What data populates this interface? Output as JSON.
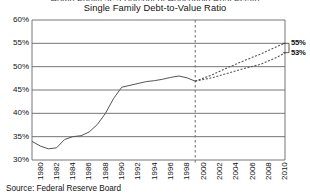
{
  "chart_data": {
    "type": "line",
    "title": "Single Family Debt-to-Value Ratio",
    "title_cut_off_above": "Home Equity as a Percent of Household Real Estate",
    "xlabel": "",
    "ylabel": "",
    "source": "Source: Federal Reserve Board",
    "grid": true,
    "legend_position": "none",
    "xlim": [
      1980,
      2011
    ],
    "ylim": [
      30,
      60
    ],
    "ytick_labels": [
      "30%",
      "35%",
      "40%",
      "45%",
      "50%",
      "55%",
      "60%"
    ],
    "ytick_values": [
      30,
      35,
      40,
      45,
      50,
      55,
      60
    ],
    "xtick_labels": [
      "1980",
      "1982",
      "1984",
      "1986",
      "1988",
      "1990",
      "1992",
      "1994",
      "1996",
      "1998",
      "2000",
      "2002",
      "2004",
      "2006",
      "2008",
      "2010"
    ],
    "xtick_values": [
      1980,
      1982,
      1984,
      1986,
      1988,
      1990,
      1992,
      1994,
      1996,
      1998,
      2000,
      2002,
      2004,
      2006,
      2008,
      2010
    ],
    "annotations": [
      {
        "label": "2000",
        "type": "vertical-dashed-divider",
        "x": 2000
      }
    ],
    "series": [
      {
        "name": "Historical Debt-to-Value Ratio",
        "style": "solid",
        "color": "#555555",
        "x": [
          1980,
          1981,
          1982,
          1983,
          1984,
          1985,
          1986,
          1987,
          1988,
          1989,
          1990,
          1991,
          1992,
          1993,
          1994,
          1995,
          1996,
          1997,
          1998,
          1999,
          2000
        ],
        "values": [
          34.0,
          33.0,
          32.4,
          32.6,
          34.4,
          35.0,
          35.2,
          36.0,
          37.6,
          40.0,
          43.2,
          45.6,
          46.0,
          46.4,
          46.8,
          47.0,
          47.3,
          47.7,
          48.0,
          47.6,
          46.9
        ]
      },
      {
        "name": "Forecast High",
        "style": "dashed",
        "color": "#555555",
        "x": [
          2000,
          2002,
          2004,
          2006,
          2008,
          2010,
          2011
        ],
        "values": [
          46.9,
          48.2,
          49.8,
          51.3,
          52.7,
          54.3,
          55.0
        ]
      },
      {
        "name": "Forecast Low",
        "style": "dashed",
        "color": "#555555",
        "x": [
          2000,
          2002,
          2004,
          2006,
          2008,
          2010,
          2011
        ],
        "values": [
          46.9,
          47.6,
          48.6,
          49.6,
          50.5,
          52.0,
          53.0
        ]
      }
    ],
    "endpoint_labels": [
      {
        "text": "55%",
        "value": 55,
        "series": "Forecast High"
      },
      {
        "text": "53%",
        "value": 53,
        "series": "Forecast Low"
      }
    ]
  }
}
